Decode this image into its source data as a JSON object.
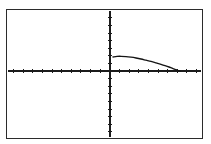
{
  "graph": {
    "title": "Graphing calculator plot",
    "background_color": "#ffffff",
    "frame": {
      "name": "plot-frame",
      "x": 6,
      "y": 9,
      "width": 197,
      "height": 130,
      "border_color": "#2b2b2b",
      "border_width": 1
    },
    "axes": {
      "color": "#1b1b1b",
      "origin_x": 110,
      "origin_y": 71,
      "x_axis": {
        "label": "x-axis",
        "start_x": 8,
        "end_x": 201,
        "y": 71,
        "tick_spacing": 9.6,
        "tick_length": 5,
        "tick_count_left": 10,
        "tick_count_right": 9
      },
      "y_axis": {
        "label": "y-axis",
        "x": 110,
        "start_y": 11,
        "end_y": 137,
        "tick_spacing": 7.6,
        "tick_length": 5,
        "tick_count_above": 7,
        "tick_count_below": 8
      }
    }
  },
  "chart_data": {
    "type": "line",
    "title": "",
    "xlabel": "",
    "ylabel": "",
    "grid": false,
    "legend": "none",
    "xlim": [
      -10.6,
      9.5
    ],
    "ylim": [
      -8.7,
      7.9
    ],
    "series": [
      {
        "name": "curve",
        "color": "#141414",
        "points_px": [
          [
            113,
            57.0
          ],
          [
            117,
            56.4
          ],
          [
            121,
            56.3
          ],
          [
            126,
            56.6
          ],
          [
            131,
            57.2
          ],
          [
            136,
            58.0
          ],
          [
            141,
            59.0
          ],
          [
            146,
            60.2
          ],
          [
            151,
            61.4
          ],
          [
            156,
            62.8
          ],
          [
            161,
            64.3
          ],
          [
            165,
            65.6
          ],
          [
            169,
            67.0
          ],
          [
            172,
            68.2
          ],
          [
            175,
            69.3
          ],
          [
            177,
            70.1
          ],
          [
            179,
            70.8
          ],
          [
            180,
            71.2
          ]
        ],
        "x": [
          0.31,
          0.73,
          1.15,
          1.67,
          2.19,
          2.71,
          3.23,
          3.75,
          4.27,
          4.79,
          5.31,
          5.73,
          6.15,
          6.46,
          6.77,
          6.98,
          7.19,
          7.29
        ],
        "y": [
          1.84,
          1.92,
          1.93,
          1.89,
          1.82,
          1.71,
          1.58,
          1.42,
          1.26,
          1.08,
          0.88,
          0.71,
          0.53,
          0.37,
          0.22,
          0.12,
          0.03,
          -0.03
        ]
      }
    ]
  }
}
